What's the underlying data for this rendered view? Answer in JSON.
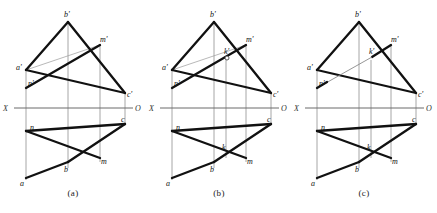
{
  "figure": {
    "axis_label_left": "X",
    "axis_label_right": "O",
    "stroke_color": "#111111",
    "thin_color": "#8a8a8a",
    "axis_color": "#6b6b6b",
    "background": "#ffffff"
  },
  "panels": [
    {
      "id": "a",
      "caption": "(a)",
      "labels": {
        "b_front": "b'",
        "a_front": "a'",
        "c_front": "c'",
        "m_front": "m'",
        "n_front": "n'",
        "a_top": "a",
        "b_top": "b",
        "c_top": "c",
        "m_top": "m",
        "n_top": "n",
        "axis_x": "X",
        "axis_o": "O"
      }
    },
    {
      "id": "b",
      "caption": "(b)",
      "labels": {
        "b_front": "b'",
        "a_front": "a'",
        "c_front": "c'",
        "m_front": "m'",
        "n_front": "n'",
        "k_front": "k'",
        "a_top": "a",
        "b_top": "b",
        "c_top": "c",
        "m_top": "m",
        "n_top": "n",
        "k_top": "k",
        "axis_x": "X",
        "axis_o": "O"
      }
    },
    {
      "id": "c",
      "caption": "(c)",
      "labels": {
        "b_front": "b'",
        "a_front": "a'",
        "c_front": "c'",
        "m_front": "m'",
        "n_front": "n'",
        "k_front": "k'",
        "a_top": "a",
        "b_top": "b",
        "c_top": "c",
        "m_top": "m",
        "n_top": "n",
        "k_top": "k",
        "axis_x": "X",
        "axis_o": "O"
      }
    }
  ],
  "geometry": {
    "note": "coordinates are local to each 146x213 panel",
    "front": {
      "b": [
        68,
        22
      ],
      "a": [
        26,
        70
      ],
      "c": [
        125,
        93
      ],
      "m": [
        100,
        45
      ],
      "n": [
        26,
        88
      ],
      "k": [
        84,
        62
      ]
    },
    "top": {
      "a": [
        26,
        178
      ],
      "b": [
        68,
        162
      ],
      "c": [
        125,
        124
      ],
      "m": [
        100,
        158
      ],
      "n": [
        26,
        131
      ],
      "k": [
        80,
        152
      ]
    },
    "axis_y": 108,
    "axis_x_start": 14,
    "axis_x_end": 133,
    "projectors_x": [
      26,
      68,
      100,
      125
    ]
  }
}
